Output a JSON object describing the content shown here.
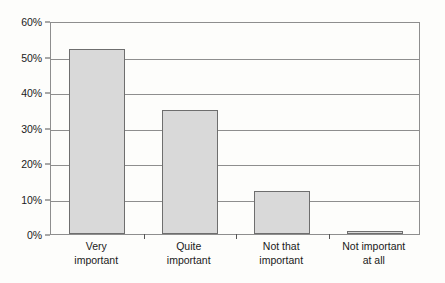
{
  "chart_data": {
    "type": "bar",
    "title": "",
    "subtitle": "",
    "xlabel": "",
    "ylabel": "",
    "categories": [
      "Very important",
      "Quite important",
      "Not that important",
      "Not important at all"
    ],
    "category_lines": [
      [
        "Very",
        "important"
      ],
      [
        "Quite",
        "important"
      ],
      [
        "Not that",
        "important"
      ],
      [
        "Not important",
        "at all"
      ]
    ],
    "values": [
      52,
      35,
      12,
      0.5
    ],
    "value_labels": [
      "52%",
      "35%",
      "12%",
      "0.5%"
    ],
    "ylim": [
      0,
      60
    ],
    "ytick_values": [
      0,
      10,
      20,
      30,
      40,
      50,
      60
    ],
    "ytick_labels": [
      "0%",
      "10%",
      "20%",
      "30%",
      "40%",
      "50%",
      "60%"
    ],
    "grid": true,
    "grid_axis": "y",
    "legend": false,
    "legend_position": "none",
    "annotations": []
  },
  "style": {
    "bar_fill": "#d9d9d9",
    "bar_border": "#6e6e6e",
    "grid_color": "#8e8e8e",
    "axis_color": "#555555",
    "text_color": "#1a1a1a",
    "background": "#fdfdfb"
  }
}
